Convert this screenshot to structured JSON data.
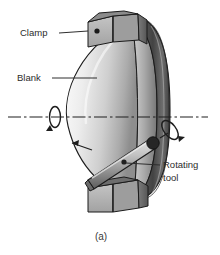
{
  "figure": {
    "caption": "(a)",
    "background_color": "#ffffff",
    "line_color": "#1e1e1e",
    "text_color": "#2b2b2b"
  },
  "labels": [
    {
      "id": "clamp",
      "text": "Clamp",
      "x": 20,
      "y": 36
    },
    {
      "id": "blank",
      "text": "Blank",
      "x": 17,
      "y": 81
    },
    {
      "id": "rotating_tool",
      "line1": "Rotating",
      "line2": "tool",
      "x": 163,
      "y": 170
    }
  ],
  "parts": {
    "blank_dome": {
      "name": "Blank",
      "fill_light": "#f2f2f2",
      "fill_mid": "#c9c9c9",
      "fill_dark": "#9a9a9a"
    },
    "disc_rim": {
      "name": "disc-rim",
      "fill_dark": "#4a4a4a",
      "fill_mid": "#7d7d7d",
      "fill_light": "#bdbdbd"
    },
    "clamp_top": {
      "name": "top-clamp-block",
      "fill_face": "#b5b5b5",
      "fill_side": "#6e6e6e",
      "fill_top": "#8f8f8f",
      "bolt_color": "#1a1a1a"
    },
    "clamp_bottom": {
      "name": "bottom-clamp-block",
      "fill_face": "#b5b5b5",
      "fill_side": "#6e6e6e",
      "fill_top": "#8f8f8f"
    },
    "tool_bar": {
      "name": "rotating-tool-bar",
      "fill_light": "#d9d9d9",
      "fill_mid": "#9e9e9e",
      "fill_dark": "#5f5f5f",
      "tip_color": "#2a2a2a"
    }
  },
  "annotations": {
    "spindle_axis": {
      "name": "center-axis-line",
      "style": "dash-dot",
      "color": "#1e1e1e"
    },
    "blank_rotation_arrow": {
      "name": "blank-rotation-arrow",
      "description": "loop arrow about spindle axis"
    },
    "tool_rotation_arrow": {
      "name": "tool-rotation-arrow",
      "description": "loop arrow about tool axis"
    },
    "feed_arrow": {
      "name": "feed-direction-arrow",
      "description": "arrow along blank surface"
    }
  }
}
